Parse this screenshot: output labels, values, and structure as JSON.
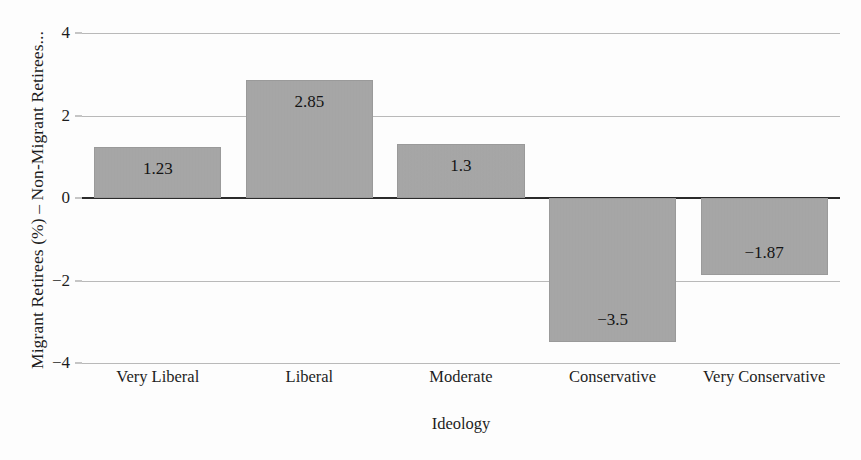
{
  "chart_data": {
    "type": "bar",
    "title": "",
    "subtitle": "",
    "xlabel": "Ideology",
    "ylabel": "Migrant Retirees (%) – Non-Migrant Retirees...",
    "categories": [
      "Very Liberal",
      "Liberal",
      "Moderate",
      "Conservative",
      "Very Conservative"
    ],
    "values": [
      1.23,
      2.85,
      1.3,
      -3.5,
      -1.87
    ],
    "value_labels": [
      "1.23",
      "2.85",
      "1.3",
      "−3.5",
      "−1.87"
    ],
    "ylim": [
      -4,
      4
    ],
    "yticks": [
      4,
      2,
      0,
      -2,
      -4
    ],
    "ytick_labels": [
      "4",
      "2",
      "0",
      "−2",
      "−4"
    ],
    "grid": true,
    "grid_axis": "y",
    "legend": null,
    "legend_position": "none",
    "bar_color": "#a7a7a7",
    "bar_edge_color": "#9a9a9a",
    "gridline_color": "#b9b9b9",
    "zero_line_color": "#2b2b2b",
    "background_color": "#fdfdfd",
    "text_color": "#1d1d1d",
    "annotations": []
  }
}
